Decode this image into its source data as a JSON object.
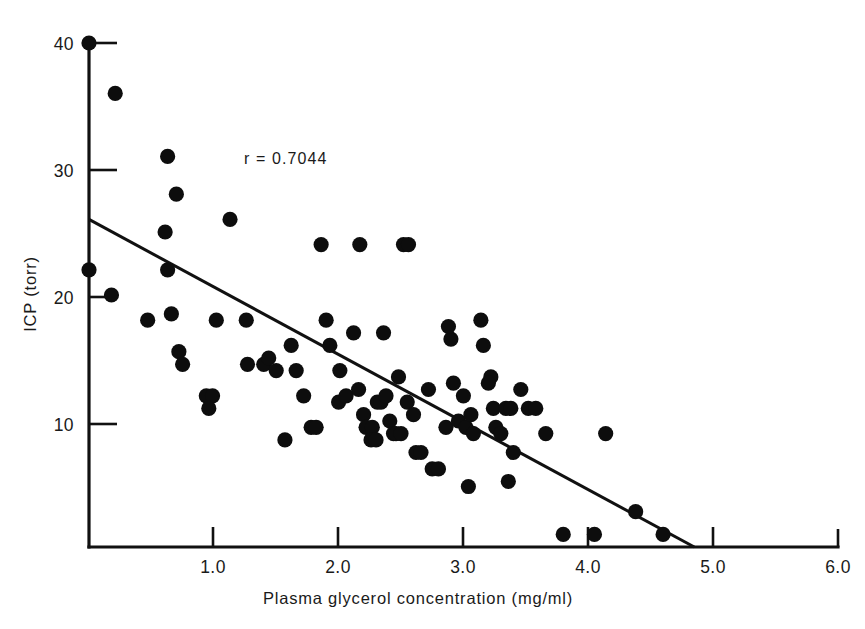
{
  "chart_data": {
    "type": "scatter",
    "title": "",
    "xlabel": "Plasma glycerol concentration (mg/ml)",
    "ylabel": "ICP (torr)",
    "xlim": [
      0,
      6.0
    ],
    "ylim": [
      0,
      41
    ],
    "grid": false,
    "legend": null,
    "annotations": [
      {
        "text": "r = 0.7044",
        "x": 1.95,
        "y": 31.0
      }
    ],
    "xticks": [
      0,
      1.0,
      2.0,
      3.0,
      4.0,
      5.0,
      6.0
    ],
    "xticklabels": [
      "",
      "1.0",
      "2.0",
      "3.0",
      "4.0",
      "5.0",
      "6.0"
    ],
    "yticks": [
      0,
      10,
      20,
      30,
      40
    ],
    "yticklabels": [
      "",
      "10",
      "20",
      "30",
      "40"
    ],
    "series": [
      {
        "name": "Patients",
        "marker": "filled-circle",
        "color": "#0d0d0d",
        "points": [
          [
            0.0,
            40.0
          ],
          [
            0.21,
            36.0
          ],
          [
            0.0,
            22.0
          ],
          [
            0.18,
            20.0
          ],
          [
            0.47,
            18.0
          ],
          [
            0.63,
            31.0
          ],
          [
            0.7,
            28.0
          ],
          [
            0.61,
            25.0
          ],
          [
            0.63,
            22.0
          ],
          [
            0.66,
            18.5
          ],
          [
            0.72,
            15.5
          ],
          [
            0.75,
            14.5
          ],
          [
            0.94,
            12.0
          ],
          [
            0.99,
            12.0
          ],
          [
            0.96,
            11.0
          ],
          [
            1.13,
            26.0
          ],
          [
            1.02,
            18.0
          ],
          [
            1.26,
            18.0
          ],
          [
            1.27,
            14.5
          ],
          [
            1.4,
            14.5
          ],
          [
            1.44,
            15.0
          ],
          [
            1.5,
            14.0
          ],
          [
            1.57,
            8.5
          ],
          [
            1.62,
            16.0
          ],
          [
            1.66,
            14.0
          ],
          [
            1.72,
            12.0
          ],
          [
            1.78,
            9.5
          ],
          [
            1.82,
            9.5
          ],
          [
            1.86,
            24.0
          ],
          [
            1.9,
            18.0
          ],
          [
            1.93,
            16.0
          ],
          [
            2.01,
            14.0
          ],
          [
            2.0,
            11.5
          ],
          [
            2.06,
            12.0
          ],
          [
            2.12,
            17.0
          ],
          [
            2.17,
            24.0
          ],
          [
            2.16,
            12.5
          ],
          [
            2.2,
            10.5
          ],
          [
            2.22,
            9.5
          ],
          [
            2.27,
            9.5
          ],
          [
            2.26,
            8.5
          ],
          [
            2.31,
            11.5
          ],
          [
            2.34,
            11.5
          ],
          [
            2.3,
            8.5
          ],
          [
            2.36,
            17.0
          ],
          [
            2.38,
            12.0
          ],
          [
            2.41,
            10.0
          ],
          [
            2.44,
            9.0
          ],
          [
            2.46,
            9.0
          ],
          [
            2.5,
            9.0
          ],
          [
            2.52,
            24.0
          ],
          [
            2.56,
            24.0
          ],
          [
            2.48,
            13.5
          ],
          [
            2.55,
            11.5
          ],
          [
            2.6,
            10.5
          ],
          [
            2.62,
            7.5
          ],
          [
            2.66,
            7.5
          ],
          [
            2.72,
            12.5
          ],
          [
            2.75,
            6.2
          ],
          [
            2.8,
            6.2
          ],
          [
            2.86,
            9.5
          ],
          [
            2.9,
            16.5
          ],
          [
            2.88,
            17.5
          ],
          [
            2.92,
            13.0
          ],
          [
            2.96,
            10.0
          ],
          [
            3.0,
            12.0
          ],
          [
            3.02,
            9.5
          ],
          [
            3.06,
            10.5
          ],
          [
            3.08,
            9.0
          ],
          [
            3.04,
            4.8
          ],
          [
            3.14,
            18.0
          ],
          [
            3.16,
            16.0
          ],
          [
            3.22,
            13.5
          ],
          [
            3.2,
            13.0
          ],
          [
            3.24,
            11.0
          ],
          [
            3.26,
            9.5
          ],
          [
            3.3,
            9.0
          ],
          [
            3.34,
            11.0
          ],
          [
            3.38,
            11.0
          ],
          [
            3.4,
            7.5
          ],
          [
            3.36,
            5.2
          ],
          [
            3.46,
            12.5
          ],
          [
            3.52,
            11.0
          ],
          [
            3.58,
            11.0
          ],
          [
            3.66,
            9.0
          ],
          [
            3.8,
            1.0
          ],
          [
            4.05,
            1.0
          ],
          [
            4.14,
            9.0
          ],
          [
            4.38,
            2.8
          ],
          [
            4.6,
            1.0
          ]
        ]
      }
    ],
    "regression_line": {
      "name": "least-squares fit",
      "x_start": 0.0,
      "y_start": 26.0,
      "x_end": 4.85,
      "y_end": 0.0,
      "color": "#111111"
    }
  }
}
